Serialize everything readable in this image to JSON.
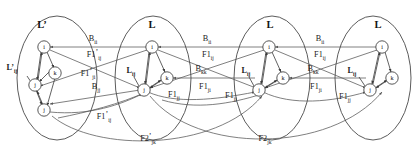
{
  "diagram": {
    "colors": {
      "stroke": "#4a4a4a",
      "edge": "#555555",
      "node_fill": "#ffffff",
      "text": "#111111",
      "background": "#ffffff"
    },
    "groups": [
      {
        "id": "g1",
        "label": "L’",
        "cx": 57,
        "cy": 78,
        "rx": 40,
        "ry": 62,
        "nodes": [
          {
            "id": "g1i",
            "label": "i",
            "x": 44,
            "y": 47
          },
          {
            "id": "g1k",
            "label": "k",
            "x": 55,
            "y": 73
          },
          {
            "id": "g1j",
            "label": "j",
            "x": 35,
            "y": 85
          },
          {
            "id": "g1j2",
            "label": "j",
            "x": 44,
            "y": 110
          }
        ],
        "inner_label": {
          "text": "L’",
          "sub": "ij",
          "x": 12,
          "y": 70
        }
      },
      {
        "id": "g2",
        "label": "L",
        "cx": 153,
        "cy": 78,
        "rx": 38,
        "ry": 62,
        "nodes": [
          {
            "id": "g2i",
            "label": "i",
            "x": 152,
            "y": 47
          },
          {
            "id": "g2k",
            "label": "k",
            "x": 167,
            "y": 78
          },
          {
            "id": "g2j",
            "label": "j",
            "x": 144,
            "y": 90
          }
        ],
        "inner_label": {
          "text": "L",
          "sub": "ij",
          "x": 131,
          "y": 73
        }
      },
      {
        "id": "g3",
        "label": "L",
        "cx": 272,
        "cy": 78,
        "rx": 38,
        "ry": 62,
        "nodes": [
          {
            "id": "g3i",
            "label": "i",
            "x": 269,
            "y": 47
          },
          {
            "id": "g3k",
            "label": "k",
            "x": 283,
            "y": 78
          },
          {
            "id": "g3j",
            "label": "j",
            "x": 259,
            "y": 90
          }
        ],
        "inner_label": {
          "text": "L",
          "sub": "ij",
          "x": 246,
          "y": 73
        }
      },
      {
        "id": "g4",
        "label": "L",
        "cx": 373,
        "cy": 78,
        "rx": 38,
        "ry": 62,
        "nodes": [
          {
            "id": "g4i",
            "label": "i",
            "x": 382,
            "y": 47
          },
          {
            "id": "g4k",
            "label": "k",
            "x": 392,
            "y": 78
          },
          {
            "id": "g4j",
            "label": "j",
            "x": 370,
            "y": 90
          }
        ],
        "inner_label": {
          "text": "L",
          "sub": "ij",
          "x": 352,
          "y": 73
        }
      }
    ],
    "edge_labels": [
      {
        "id": "lbl-b-ii-1",
        "text": "B",
        "sub": "ii",
        "prime": false,
        "x": 93,
        "y": 41
      },
      {
        "id": "lbl-b-ii-2",
        "text": "B",
        "sub": "ii",
        "prime": false,
        "x": 207,
        "y": 41
      },
      {
        "id": "lbl-b-ii-3",
        "text": "B",
        "sub": "ii",
        "prime": false,
        "x": 320,
        "y": 41
      },
      {
        "id": "lbl-f1p-ij-top",
        "text": "F1",
        "sub": "ij",
        "prime": true,
        "x": 94,
        "y": 57
      },
      {
        "id": "lbl-f1-ij-2",
        "text": "F1",
        "sub": "ij",
        "prime": false,
        "x": 208,
        "y": 57
      },
      {
        "id": "lbl-f1-ij-3",
        "text": "F1",
        "sub": "ij",
        "prime": false,
        "x": 320,
        "y": 57
      },
      {
        "id": "lbl-f1p-ji",
        "text": "F1",
        "sub": "ji",
        "prime": true,
        "x": 88,
        "y": 76
      },
      {
        "id": "lbl-b-kk-1",
        "text": "B",
        "sub": "kk",
        "prime": false,
        "x": 201,
        "y": 71
      },
      {
        "id": "lbl-b-kk-2",
        "text": "B",
        "sub": "kk",
        "prime": false,
        "x": 313,
        "y": 71
      },
      {
        "id": "lbl-b-jj",
        "text": "B",
        "sub": "jj",
        "prime": false,
        "x": 96,
        "y": 89
      },
      {
        "id": "lbl-f1-ji-2",
        "text": "F1",
        "sub": "ji",
        "prime": false,
        "x": 205,
        "y": 89
      },
      {
        "id": "lbl-f1-ji-3",
        "text": "F1",
        "sub": "ji",
        "prime": false,
        "x": 316,
        "y": 89
      },
      {
        "id": "lbl-f1-jj-2",
        "text": "F1",
        "sub": "jj",
        "prime": false,
        "x": 174,
        "y": 97
      },
      {
        "id": "lbl-f1-jj-3",
        "text": "F1",
        "sub": "jj",
        "prime": false,
        "x": 231,
        "y": 98
      },
      {
        "id": "lbl-f1-jj-4",
        "text": "F1",
        "sub": "jj",
        "prime": false,
        "x": 345,
        "y": 99
      },
      {
        "id": "lbl-f1p-ij-bot",
        "text": "F1",
        "sub": "ij",
        "prime": true,
        "x": 104,
        "y": 119
      },
      {
        "id": "lbl-f2p-jk",
        "text": "F2",
        "sub": "jk",
        "prime": true,
        "x": 148,
        "y": 141
      },
      {
        "id": "lbl-f2-jk",
        "text": "F2",
        "sub": "jk",
        "prime": false,
        "x": 265,
        "y": 141
      }
    ]
  }
}
